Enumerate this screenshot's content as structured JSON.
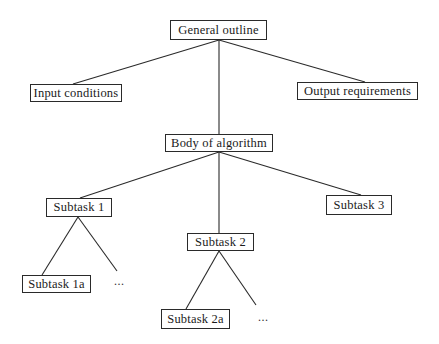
{
  "diagram": {
    "type": "tree",
    "title": "",
    "nodes": [
      {
        "id": "general",
        "label": "General outline",
        "x": 170,
        "y": 20,
        "w": 97,
        "h": 20
      },
      {
        "id": "input",
        "label": "Input conditions",
        "x": 30,
        "y": 84,
        "w": 92,
        "h": 18
      },
      {
        "id": "output",
        "label": "Output requirements",
        "x": 297,
        "y": 82,
        "w": 121,
        "h": 18
      },
      {
        "id": "body",
        "label": "Body of algorithm",
        "x": 165,
        "y": 134,
        "w": 108,
        "h": 18
      },
      {
        "id": "sub1",
        "label": "Subtask 1",
        "x": 46,
        "y": 198,
        "w": 66,
        "h": 19
      },
      {
        "id": "sub2",
        "label": "Subtask 2",
        "x": 187,
        "y": 233,
        "w": 67,
        "h": 18
      },
      {
        "id": "sub3",
        "label": "Subtask 3",
        "x": 326,
        "y": 195,
        "w": 66,
        "h": 20
      },
      {
        "id": "sub1a",
        "label": "Subtask 1a",
        "x": 22,
        "y": 275,
        "w": 69,
        "h": 18
      },
      {
        "id": "sub2a",
        "label": "Subtask 2a",
        "x": 161,
        "y": 309,
        "w": 69,
        "h": 20
      }
    ],
    "ellipses": [
      {
        "id": "sub1-more",
        "label": "...",
        "x": 114,
        "y": 274
      },
      {
        "id": "sub2-more",
        "label": "...",
        "x": 258,
        "y": 310
      }
    ],
    "edges": [
      {
        "from": "general",
        "to": "input",
        "x1": 219,
        "y1": 40,
        "x2": 73,
        "y2": 84
      },
      {
        "from": "general",
        "to": "output",
        "x1": 219,
        "y1": 40,
        "x2": 365,
        "y2": 82
      },
      {
        "from": "general",
        "to": "body",
        "x1": 219,
        "y1": 40,
        "x2": 219,
        "y2": 134
      },
      {
        "from": "body",
        "to": "sub1",
        "x1": 219,
        "y1": 152,
        "x2": 80,
        "y2": 198
      },
      {
        "from": "body",
        "to": "sub3",
        "x1": 219,
        "y1": 152,
        "x2": 361,
        "y2": 195
      },
      {
        "from": "body",
        "to": "sub2",
        "x1": 219,
        "y1": 152,
        "x2": 219,
        "y2": 233
      },
      {
        "from": "sub1",
        "to": "sub1a",
        "x1": 78,
        "y1": 217,
        "x2": 42,
        "y2": 275
      },
      {
        "from": "sub1",
        "to": "sub1-more",
        "x1": 78,
        "y1": 217,
        "x2": 117,
        "y2": 271
      },
      {
        "from": "sub2",
        "to": "sub2a",
        "x1": 219,
        "y1": 251,
        "x2": 186,
        "y2": 309
      },
      {
        "from": "sub2",
        "to": "sub2-more",
        "x1": 219,
        "y1": 251,
        "x2": 256,
        "y2": 305
      }
    ]
  },
  "colors": {
    "background": "#ffffff",
    "stroke": "#2a2a2a",
    "text": "#1a1a1a"
  }
}
